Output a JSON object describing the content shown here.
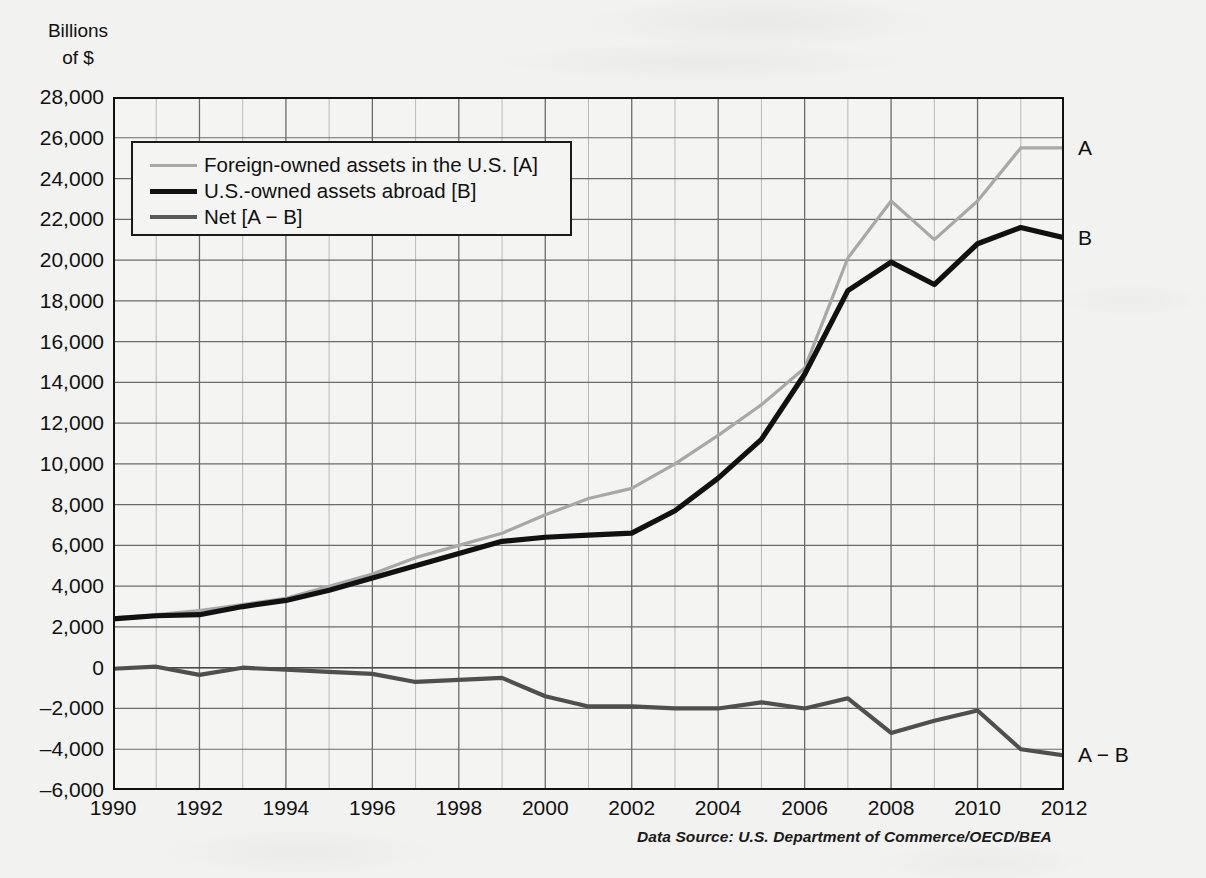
{
  "axis_title": "Billions\nof $",
  "source_note": "Data Source: U.S. Department of Commerce/OECD/BEA",
  "legend": {
    "items": [
      {
        "label": "Foreign-owned assets in the U.S. [A]",
        "color": "#a8a8a8",
        "width": 3
      },
      {
        "label": "U.S.-owned assets abroad [B]",
        "color": "#111111",
        "width": 5
      },
      {
        "label": "Net [A − B]",
        "color": "#5a5a5a",
        "width": 4
      }
    ]
  },
  "right_labels": [
    {
      "text": "A",
      "value": 25500
    },
    {
      "text": "B",
      "value": 21100
    },
    {
      "text": "A − B",
      "value": -4300
    }
  ],
  "chart_data": {
    "type": "line",
    "title": "",
    "xlabel": "",
    "ylabel": "Billions of $",
    "xlim": [
      1990,
      2012
    ],
    "ylim": [
      -6000,
      28000
    ],
    "ytick_step": 2000,
    "xtick_step": 2,
    "grid": true,
    "grid_minor_x_step": 1,
    "legend_position": "inside-top-left",
    "ytick_labels": [
      "28,000",
      "26,000",
      "24,000",
      "22,000",
      "20,000",
      "18,000",
      "16,000",
      "14,000",
      "12,000",
      "10,000",
      "8,000",
      "6,000",
      "4,000",
      "2,000",
      "0",
      "–2,000",
      "–4,000",
      "–6,000"
    ],
    "ytick_values": [
      28000,
      26000,
      24000,
      22000,
      20000,
      18000,
      16000,
      14000,
      12000,
      10000,
      8000,
      6000,
      4000,
      2000,
      0,
      -2000,
      -4000,
      -6000
    ],
    "xtick_labels": [
      "1990",
      "1992",
      "1994",
      "1996",
      "1998",
      "2000",
      "2002",
      "2004",
      "2006",
      "2008",
      "2010",
      "2012"
    ],
    "xtick_values": [
      1990,
      1992,
      1994,
      1996,
      1998,
      2000,
      2002,
      2004,
      2006,
      2008,
      2010,
      2012
    ],
    "x": [
      1990,
      1991,
      1992,
      1993,
      1994,
      1995,
      1996,
      1997,
      1998,
      1999,
      2000,
      2001,
      2002,
      2003,
      2004,
      2005,
      2006,
      2007,
      2008,
      2009,
      2010,
      2011,
      2012
    ],
    "series": [
      {
        "name": "Foreign-owned assets in the U.S. [A]",
        "key": "A",
        "color": "#a8a8a8",
        "width": 3.2,
        "values": [
          2450,
          2600,
          2800,
          3100,
          3400,
          4000,
          4600,
          5400,
          6000,
          6600,
          7500,
          8300,
          8800,
          10000,
          11400,
          12900,
          14700,
          20100,
          22900,
          21000,
          22900,
          25500,
          25500
        ]
      },
      {
        "name": "U.S.-owned assets abroad [B]",
        "key": "B",
        "color": "#111111",
        "width": 5.2,
        "values": [
          2400,
          2550,
          2600,
          3000,
          3300,
          3800,
          4400,
          5000,
          5600,
          6200,
          6400,
          6500,
          6600,
          7700,
          9300,
          11200,
          14400,
          18500,
          19900,
          18800,
          20800,
          21600,
          21100
        ]
      },
      {
        "name": "Net [A − B]",
        "key": "NET",
        "color": "#4f4f4f",
        "width": 4.2,
        "values": [
          -50,
          50,
          -350,
          0,
          -100,
          -200,
          -300,
          -700,
          -600,
          -500,
          -1400,
          -1900,
          -1900,
          -2000,
          -2000,
          -1700,
          -2000,
          -1500,
          -3200,
          -2600,
          -2100,
          -4000,
          -4300
        ]
      }
    ]
  }
}
